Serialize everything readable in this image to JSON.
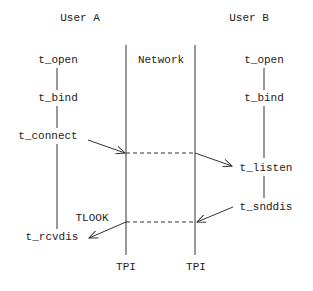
{
  "diagram": {
    "columns": {
      "user_a": "User A",
      "network": "Network",
      "user_b": "User B"
    },
    "user_a_calls": [
      "t_open",
      "t_bind",
      "t_connect",
      "t_rcvdis"
    ],
    "user_b_calls": [
      "t_open",
      "t_bind",
      "t_listen",
      "t_snddis"
    ],
    "event_label": "TLOOK",
    "boundary_labels": [
      "TPI",
      "TPI"
    ],
    "colors": {
      "line": "#333333",
      "text": "#222222",
      "background": "#ffffff"
    }
  }
}
